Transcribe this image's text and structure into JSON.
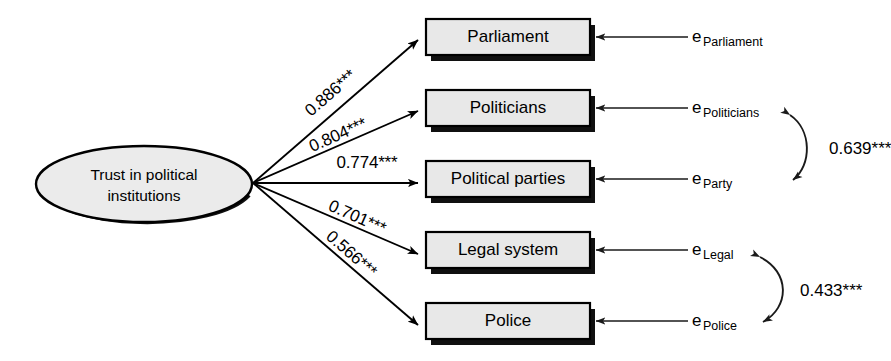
{
  "diagram": {
    "latent": {
      "id": "trust-in-political-institutions",
      "line1": "Trust in political",
      "line2": "institutions"
    },
    "indicators": [
      {
        "id": "parliament",
        "label": "Parliament",
        "loading": "0.886***",
        "error_base": "e",
        "error_sub": "Parliament"
      },
      {
        "id": "politicians",
        "label": "Politicians",
        "loading": "0.804***",
        "error_base": "e",
        "error_sub": "Politicians"
      },
      {
        "id": "political-parties",
        "label": "Political parties",
        "loading": "0.774***",
        "error_base": "e",
        "error_sub": "Party"
      },
      {
        "id": "legal-system",
        "label": "Legal system",
        "loading": "0.701***",
        "error_base": "e",
        "error_sub": "Legal"
      },
      {
        "id": "police",
        "label": "Police",
        "loading": "0.566***",
        "error_base": "e",
        "error_sub": "Police"
      }
    ],
    "correlations": [
      {
        "id": "politicians-party",
        "value": "0.639***",
        "from": "e_Politicians",
        "to": "e_Party"
      },
      {
        "id": "legal-police",
        "value": "0.433***",
        "from": "e_Legal",
        "to": "e_Police"
      }
    ],
    "colors": {
      "node_fill": "#e8e8e8",
      "latent_fill": "#ebebeb",
      "stroke": "#000000",
      "background": "#ffffff"
    }
  }
}
